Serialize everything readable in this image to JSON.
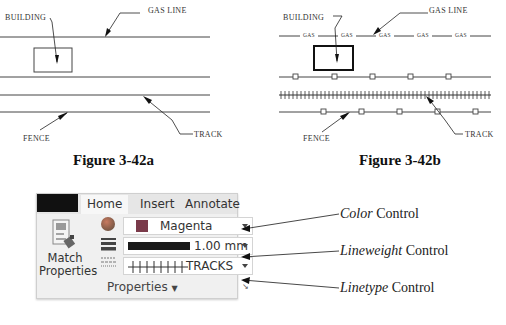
{
  "figure_a": {
    "caption": "Figure 3-42a",
    "labels": {
      "building": "BUILDING",
      "gas_line": "GAS LINE",
      "fence": "FENCE",
      "track": "TRACK"
    }
  },
  "figure_b": {
    "caption": "Figure 3-42b",
    "labels": {
      "building": "BUILDING",
      "gas_line": "GAS LINE",
      "fence": "FENCE",
      "track": "TRACK"
    },
    "gas_segment_label": "GAS",
    "gas_segments": [
      "GAS",
      "GAS",
      "GAS",
      "GAS",
      "GAS"
    ]
  },
  "ribbon": {
    "tabs": [
      {
        "label": "Home",
        "active": true
      },
      {
        "label": "Insert",
        "active": false
      },
      {
        "label": "Annotate",
        "active": false
      }
    ],
    "match_properties": {
      "line1": "Match",
      "line2": "Properties"
    },
    "color_control": {
      "value": "Magenta",
      "swatch_color": "#7a3a4a"
    },
    "lineweight_control": {
      "value": "1.00 mm"
    },
    "linetype_control": {
      "value": "TRACKS"
    },
    "panel_title": "Properties",
    "panel_dropdown_icon": "triangle-down-icon",
    "panel_launcher_icon": "dialog-launcher-icon"
  },
  "callouts": [
    {
      "italic": "Color",
      "rest": " Control"
    },
    {
      "italic": "Lineweight",
      "rest": " Control"
    },
    {
      "italic": "Linetype",
      "rest": " Control"
    }
  ]
}
